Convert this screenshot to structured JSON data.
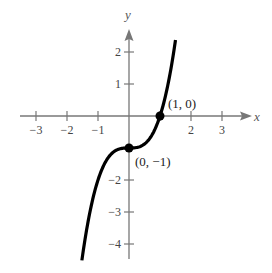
{
  "chart_data": {
    "type": "line",
    "title": "",
    "xlabel": "x",
    "ylabel": "y",
    "function": "y = x^3 - 1",
    "xlim": [
      -3.5,
      3.9
    ],
    "ylim": [
      -4.5,
      2.7
    ],
    "grid": false,
    "x_ticks": [
      {
        "value": -3,
        "label": "−3"
      },
      {
        "value": -2,
        "label": "−2"
      },
      {
        "value": -1,
        "label": "−1"
      },
      {
        "value": 1,
        "label": ""
      },
      {
        "value": 2,
        "label": "2"
      },
      {
        "value": 3,
        "label": "3"
      }
    ],
    "y_ticks": [
      {
        "value": 2,
        "label": "2"
      },
      {
        "value": 1,
        "label": "1"
      },
      {
        "value": -1,
        "label": ""
      },
      {
        "value": -2,
        "label": "−2"
      },
      {
        "value": -3,
        "label": "−3"
      },
      {
        "value": -4,
        "label": "−4"
      }
    ],
    "series": [
      {
        "name": "curve",
        "x": [
          -1.52,
          -1.25,
          -1.0,
          -0.75,
          -0.5,
          -0.25,
          0,
          0.25,
          0.5,
          0.75,
          1.0,
          1.25,
          1.5
        ],
        "y": [
          -4.51,
          -2.95,
          -2.0,
          -1.42,
          -1.13,
          -1.02,
          -1.0,
          -0.98,
          -0.88,
          -0.58,
          0.0,
          0.95,
          2.38
        ]
      }
    ],
    "points": [
      {
        "x": 0,
        "y": -1,
        "label": "(0, −1)"
      },
      {
        "x": 1,
        "y": 0,
        "label": "(1, 0)"
      }
    ]
  }
}
